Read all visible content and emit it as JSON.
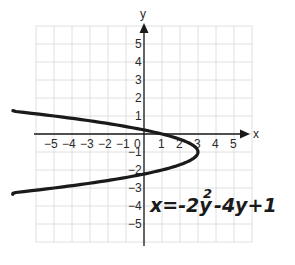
{
  "chart_data": {
    "type": "line",
    "title": "",
    "equation": "x = -2y^2 - 4y + 1",
    "annotation": {
      "base": "x=-2y",
      "exp": "2",
      "rest": "-4y+1"
    },
    "xlabel": "x",
    "ylabel": "y",
    "xlim": [
      -6,
      6
    ],
    "ylim": [
      -6,
      6
    ],
    "grid": true,
    "x_ticks": [
      "-5",
      "-4",
      "-3",
      "-2",
      "-1",
      "0",
      "1",
      "2",
      "3",
      "4",
      "5"
    ],
    "y_ticks": [
      "5",
      "4",
      "3",
      "2",
      "1",
      "-1",
      "-2",
      "-3",
      "-4",
      "-5"
    ],
    "series": [
      {
        "name": "x = -2y^2 - 4y + 1",
        "vertex": [
          3,
          -1
        ],
        "points": [
          [
            -7.3,
            1.3
          ],
          [
            -5,
            0.85
          ],
          [
            -3,
            0.5
          ],
          [
            -1,
            0.25
          ],
          [
            0,
            0.22
          ],
          [
            1,
            0
          ],
          [
            2,
            -0.3
          ],
          [
            3,
            -1
          ],
          [
            2,
            -1.7
          ],
          [
            1,
            -2
          ],
          [
            0,
            -2.2
          ],
          [
            -1,
            -2.5
          ],
          [
            -3,
            -2.85
          ],
          [
            -5,
            -3.2
          ],
          [
            -7.1,
            -3.4
          ]
        ]
      }
    ]
  },
  "labels": {
    "x_axis": "x",
    "y_axis": "y"
  }
}
